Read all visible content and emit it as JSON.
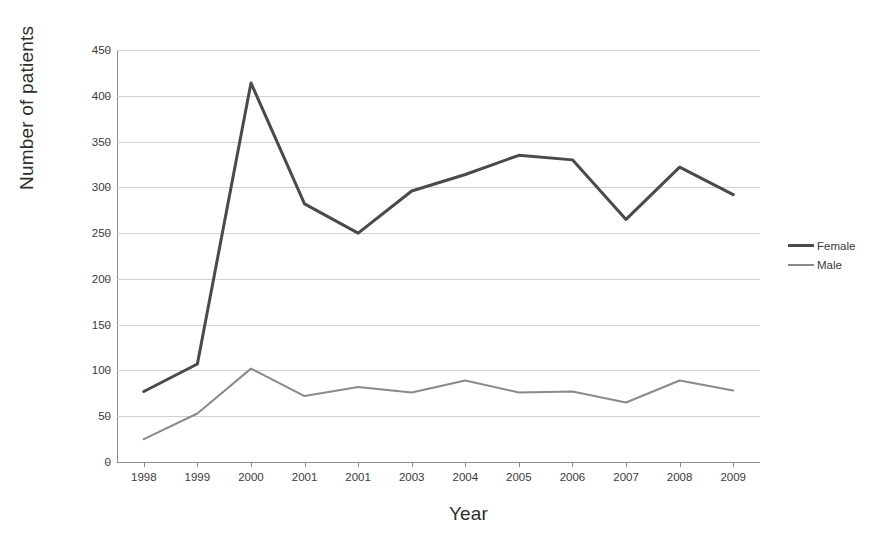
{
  "chart_data": {
    "type": "line",
    "title": "",
    "xlabel": "Year",
    "ylabel": "Number of patients",
    "categories": [
      "1998",
      "1999",
      "2000",
      "2001",
      "2001",
      "2003",
      "2004",
      "2005",
      "2006",
      "2007",
      "2008",
      "2009"
    ],
    "series": [
      {
        "name": "Female",
        "color": "#4a4a4a",
        "values": [
          77,
          107,
          414,
          282,
          250,
          296,
          314,
          335,
          330,
          265,
          322,
          292
        ]
      },
      {
        "name": "Male",
        "color": "#8a8a8a",
        "values": [
          25,
          53,
          102,
          72,
          82,
          76,
          89,
          76,
          77,
          65,
          89,
          78
        ]
      }
    ],
    "ylim": [
      0,
      450
    ],
    "ytick_labels": [
      "0",
      "50",
      "100",
      "150",
      "200",
      "250",
      "300",
      "350",
      "400",
      "450"
    ],
    "yticks": [
      0,
      50,
      100,
      150,
      200,
      250,
      300,
      350,
      400,
      450
    ],
    "grid": true,
    "legend_position": "right"
  },
  "legend": {
    "entries": [
      {
        "label": "Female"
      },
      {
        "label": "Male"
      }
    ]
  },
  "colors": {
    "female_line": "#4a4a4a",
    "male_line": "#8a8a8a",
    "gridline": "#c9c9c9",
    "axis": "#8f8f8f",
    "background": "#ffffff"
  }
}
